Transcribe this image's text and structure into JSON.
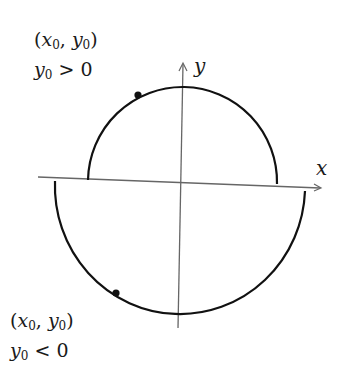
{
  "diagram": {
    "axes": {
      "x_label": "x",
      "y_label": "y",
      "axis_color": "#555555"
    },
    "curve_color": "#111111",
    "upper_point": {
      "coord_var_x": "x",
      "coord_var_y": "y",
      "subscript": "0",
      "condition_rel": ">",
      "condition_rhs": "0"
    },
    "lower_point": {
      "coord_var_x": "x",
      "coord_var_y": "y",
      "subscript": "0",
      "condition_rel": "<",
      "condition_rhs": "0"
    }
  }
}
